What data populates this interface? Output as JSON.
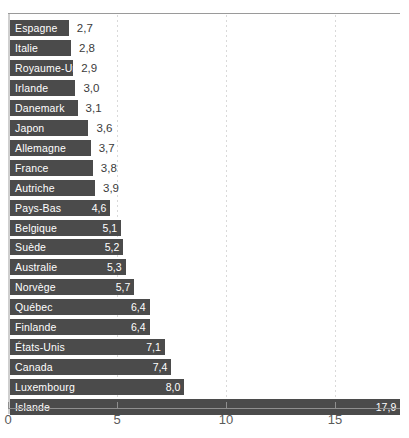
{
  "chart_data": {
    "type": "bar",
    "orientation": "horizontal",
    "title": "",
    "subtitle": "",
    "xlabel": "",
    "ylabel": "",
    "xlim": [
      0,
      18
    ],
    "grid": "vertical-dotted",
    "legend": "none",
    "xticks": [
      0,
      5,
      10,
      15
    ],
    "xtick_labels": [
      "0",
      "5",
      "10",
      "15"
    ],
    "decimal_separator": ",",
    "categories": [
      "Espagne",
      "Italie",
      "Royaume-Uni",
      "Irlande",
      "Danemark",
      "Japon",
      "Allemagne",
      "France",
      "Autriche",
      "Pays-Bas",
      "Belgique",
      "Suède",
      "Australie",
      "Norvège",
      "Québec",
      "Finlande",
      "États-Unis",
      "Canada",
      "Luxembourg",
      "Islande"
    ],
    "values": [
      2.7,
      2.8,
      2.9,
      3.0,
      3.1,
      3.6,
      3.7,
      3.8,
      3.9,
      4.6,
      5.1,
      5.2,
      5.3,
      5.7,
      6.4,
      6.4,
      7.1,
      7.4,
      8.0,
      17.9
    ],
    "value_labels": [
      "2,7",
      "2,8",
      "2,9",
      "3,0",
      "3,1",
      "3,6",
      "3,7",
      "3,8",
      "3,9",
      "4,6",
      "5,1",
      "5,2",
      "5,3",
      "5,7",
      "6,4",
      "6,4",
      "7,1",
      "7,4",
      "8,0",
      "17,9"
    ],
    "label_placement": [
      "outside",
      "outside",
      "outside",
      "outside",
      "outside",
      "outside",
      "outside",
      "outside",
      "outside",
      "inside",
      "inside",
      "inside",
      "inside",
      "inside",
      "inside",
      "inside",
      "inside",
      "inside",
      "inside",
      "inside"
    ],
    "colors": {
      "bar": "#4b4b4b",
      "bar_label_text": "#ffffff",
      "outside_value_text": "#3b3b3b",
      "axis": "#8f8f8f",
      "gridline": "#d9d9d9",
      "background": "#ffffff"
    }
  }
}
